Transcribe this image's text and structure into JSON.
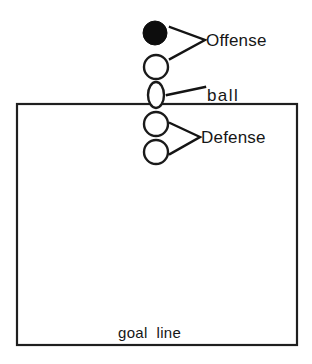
{
  "diagram": {
    "title": "goal line",
    "canvas": {
      "width": 312,
      "height": 364,
      "background": "#ffffff"
    },
    "colors": {
      "line": "#1a1a1a",
      "fill_player": "#0d0d0d",
      "open_player": "#ffffff",
      "text": "#161616"
    },
    "field": {
      "name": "playing-area-box",
      "x": 17,
      "y": 104,
      "width": 280,
      "height": 241,
      "goal_line_label": "goal  line"
    },
    "labels": {
      "offense": "Offense",
      "ball": "ball",
      "defense": "Defense",
      "goal_line": "goal  line"
    },
    "markers": [
      {
        "name": "offense-player-filled",
        "kind": "filled-circle",
        "cx": 155,
        "cy": 33,
        "r": 12,
        "group": "offense"
      },
      {
        "name": "offense-player-open",
        "kind": "open-circle",
        "cx": 156,
        "cy": 67,
        "r": 12,
        "group": "offense"
      },
      {
        "name": "ball-marker",
        "kind": "ellipse",
        "cx": 156,
        "cy": 95,
        "rx": 8,
        "ry": 13,
        "group": "ball"
      },
      {
        "name": "defense-player-upper",
        "kind": "open-circle",
        "cx": 156,
        "cy": 124,
        "r": 12,
        "group": "defense"
      },
      {
        "name": "defense-player-lower",
        "kind": "open-circle",
        "cx": 156,
        "cy": 152,
        "r": 12,
        "group": "defense"
      }
    ],
    "leaders": [
      {
        "name": "offense-leader-bracket",
        "type": "chevron",
        "apex_x": 205,
        "apex_y": 40,
        "top_x": 170,
        "top_y": 27,
        "bottom_x": 170,
        "bottom_y": 59
      },
      {
        "name": "ball-leader-line",
        "type": "line",
        "x1": 167,
        "y1": 95,
        "x2": 205,
        "y2": 87
      },
      {
        "name": "defense-leader-bracket",
        "type": "chevron",
        "apex_x": 200,
        "apex_y": 137,
        "top_x": 170,
        "top_y": 123,
        "bottom_x": 170,
        "bottom_y": 154
      }
    ],
    "text_positions": {
      "offense": {
        "x": 206,
        "y": 46
      },
      "ball": {
        "x": 207,
        "y": 100
      },
      "defense": {
        "x": 201,
        "y": 143
      },
      "goal_line": {
        "x": 118,
        "y": 338
      }
    }
  }
}
